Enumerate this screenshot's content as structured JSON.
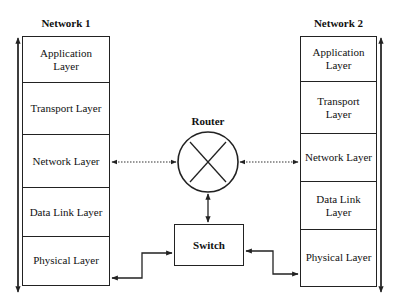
{
  "diagram": {
    "type": "network-layer-diagram",
    "network1": {
      "title": "Network 1",
      "layers": [
        {
          "label": "Application Layer"
        },
        {
          "label": "Transport Layer"
        },
        {
          "label": "Network Layer"
        },
        {
          "label": "Data Link Layer"
        },
        {
          "label": "Physical Layer"
        }
      ]
    },
    "network2": {
      "title": "Network 2",
      "layers": [
        {
          "label": "Application Layer"
        },
        {
          "label": "Transport Layer"
        },
        {
          "label": "Network Layer"
        },
        {
          "label": "Data Link Layer"
        },
        {
          "label": "Physical Layer"
        }
      ]
    },
    "router": {
      "label": "Router",
      "icon": "router-x-circle-icon"
    },
    "switch": {
      "label": "Switch"
    },
    "connections": [
      {
        "from": "Network 1 / Network Layer",
        "to": "Router",
        "style": "dotted",
        "direction": "bidirectional"
      },
      {
        "from": "Router",
        "to": "Network 2 / Network Layer",
        "style": "dotted",
        "direction": "bidirectional"
      },
      {
        "from": "Router",
        "to": "Switch",
        "style": "solid",
        "direction": "bidirectional"
      },
      {
        "from": "Network 1 / Physical Layer",
        "to": "Switch",
        "style": "solid",
        "direction": "bidirectional"
      },
      {
        "from": "Switch",
        "to": "Network 2 / Physical Layer",
        "style": "solid",
        "direction": "bidirectional"
      }
    ],
    "flow_arrows": [
      {
        "side": "Network 1",
        "direction": "bidirectional-vertical"
      },
      {
        "side": "Network 2",
        "direction": "bidirectional-vertical"
      }
    ]
  },
  "colors": {
    "line": "#222222",
    "background": "#ffffff"
  }
}
